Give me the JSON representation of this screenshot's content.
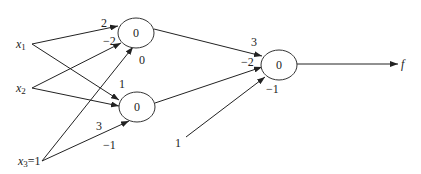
{
  "diagram": {
    "type": "neural-network",
    "inputs": [
      {
        "id": "x1",
        "label": "x",
        "sub": "1"
      },
      {
        "id": "x2",
        "label": "x",
        "sub": "2"
      },
      {
        "id": "x3",
        "label": "x",
        "sub": "3",
        "suffix": "=1"
      }
    ],
    "hidden_nodes": [
      {
        "id": "h1",
        "value": "0"
      },
      {
        "id": "h2",
        "value": "0"
      }
    ],
    "output_node": {
      "id": "o",
      "value": "0"
    },
    "output_label": "f",
    "bias_input_label": "1",
    "weights": {
      "x1_h1": "2",
      "x2_h1": "−2",
      "x3_h1": "0",
      "x1_h2": "1",
      "x3_h2": "3",
      "x3_h2_extra": "−1",
      "h1_o": "3",
      "h2_o": "−2",
      "bias_o": "−1"
    }
  }
}
